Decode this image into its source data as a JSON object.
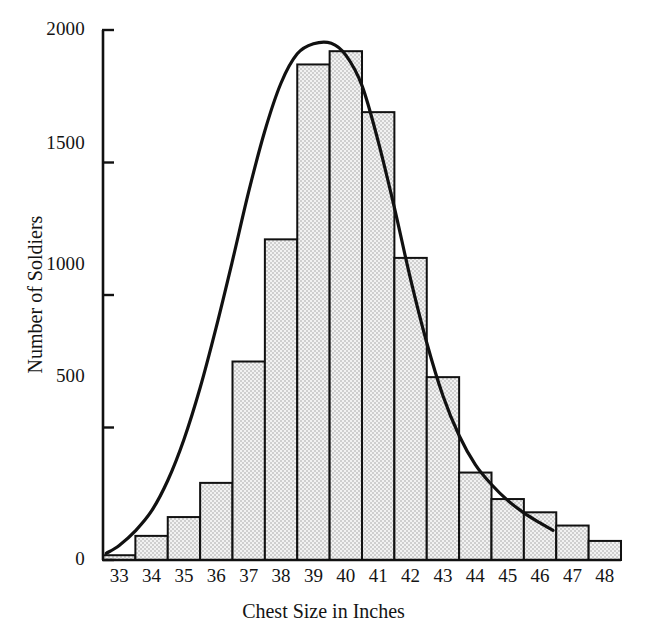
{
  "chart_data": {
    "type": "bar",
    "title": "",
    "xlabel": "Chest Size in Inches",
    "ylabel": "Number of Soldiers",
    "categories": [
      "33",
      "34",
      "35",
      "36",
      "37",
      "38",
      "39",
      "40",
      "41",
      "42",
      "43",
      "44",
      "45",
      "46",
      "47",
      "48"
    ],
    "values": [
      18,
      91,
      162,
      291,
      749,
      1210,
      1870,
      1920,
      1690,
      1140,
      690,
      330,
      230,
      180,
      130,
      72
    ],
    "xlim": [
      32.5,
      48.5
    ],
    "ylim": [
      0,
      2000
    ],
    "yticks": [
      0,
      500,
      1000,
      1500,
      2000
    ],
    "ytick_labels": [
      "0",
      "500",
      "1000",
      "1500",
      "2000"
    ],
    "xtick_labels": [
      "33",
      "34",
      "35",
      "36",
      "37",
      "38",
      "39",
      "40",
      "41",
      "42",
      "43",
      "44",
      "45",
      "46",
      "47",
      "48"
    ],
    "grid": false,
    "legend": null,
    "bar_fill": "#e8e8e8",
    "bar_edge": "#111111",
    "bar_pattern": "stipple-dots",
    "axis_color": "#111111",
    "overlay": {
      "type": "line",
      "name": "normal-curve",
      "color": "#111111",
      "line_width": 3,
      "peak_x": 39.55,
      "peak_y": 1950,
      "x_start": 32.6,
      "x_end": 46.4,
      "points_x": [
        32.6,
        33.0,
        33.5,
        34.0,
        34.5,
        35.0,
        35.5,
        36.0,
        36.5,
        37.0,
        37.5,
        38.0,
        38.5,
        39.0,
        39.55,
        40.0,
        40.5,
        41.0,
        41.5,
        42.0,
        42.5,
        43.0,
        43.5,
        44.0,
        44.5,
        45.0,
        45.5,
        46.0,
        46.4
      ],
      "points_y": [
        25,
        55,
        110,
        185,
        300,
        455,
        650,
        880,
        1130,
        1390,
        1620,
        1800,
        1910,
        1948,
        1950,
        1905,
        1790,
        1580,
        1330,
        1060,
        820,
        620,
        470,
        360,
        285,
        225,
        178,
        140,
        112
      ]
    }
  },
  "axis_titles": {
    "x": "Chest Size in Inches",
    "y": "Number of Soldiers"
  }
}
